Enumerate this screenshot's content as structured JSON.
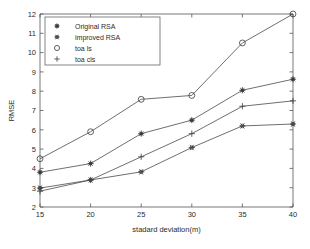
{
  "chart_data": {
    "type": "line",
    "title": "",
    "xlabel": "stadard deviation(m)",
    "ylabel": "RMSE",
    "x": [
      15,
      20,
      25,
      30,
      35,
      40
    ],
    "xlim": [
      15,
      40
    ],
    "ylim": [
      2,
      12
    ],
    "xticks": [
      15,
      20,
      25,
      30,
      35,
      40
    ],
    "yticks": [
      2,
      3,
      4,
      5,
      6,
      7,
      8,
      9,
      10,
      11,
      12
    ],
    "grid": false,
    "legend_position": "top-left",
    "series": [
      {
        "name": "Original RSA",
        "marker": "star-filled",
        "values": [
          3.8,
          4.25,
          5.8,
          6.5,
          8.05,
          8.62
        ]
      },
      {
        "name": "improved RSA",
        "marker": "hexagram",
        "values": [
          2.98,
          3.4,
          3.82,
          5.08,
          6.2,
          6.3
        ]
      },
      {
        "name": "toa ls",
        "marker": "circle-open",
        "values": [
          4.5,
          5.9,
          7.58,
          7.78,
          10.5,
          12.0
        ]
      },
      {
        "name": "toa cls",
        "marker": "plus",
        "values": [
          2.82,
          3.4,
          4.6,
          5.8,
          7.22,
          7.5
        ]
      }
    ]
  },
  "legend": {
    "entries": [
      {
        "label": "Original RSA",
        "marker": "star-filled"
      },
      {
        "label": "improved RSA",
        "marker": "hexagram"
      },
      {
        "label": "toa ls",
        "marker": "circle-open"
      },
      {
        "label": "toa cls",
        "marker": "plus"
      }
    ]
  },
  "axes": {
    "y_label": "RMSE",
    "x_label": "stadard deviation(m)",
    "x_tick_labels": [
      "15",
      "20",
      "25",
      "30",
      "35",
      "40"
    ],
    "y_tick_labels": [
      "2",
      "3",
      "4",
      "5",
      "6",
      "7",
      "8",
      "9",
      "10",
      "11",
      "12"
    ]
  },
  "colors": {
    "line": "#4a4a4a",
    "marker": "#3a3a3a",
    "axis": "#555555",
    "text": "#2b2b2b",
    "background": "#ffffff"
  }
}
